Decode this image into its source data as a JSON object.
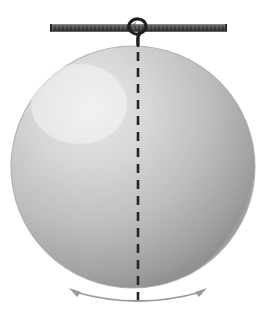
{
  "figure": {
    "type": "physics-diagram",
    "canvas": {
      "width": 269,
      "height": 328,
      "background": "#ffffff"
    },
    "support_rod": {
      "name": "horizontal support rod",
      "x_start": 50,
      "x_end": 227,
      "y_top": 24,
      "y_bottom": 31,
      "color_top": "#7c7c7c",
      "color_body": "#4a4a4a",
      "color_bottom": "#2b2b2b",
      "hatch_color": "#8d8d8d"
    },
    "hook": {
      "name": "suspension hook",
      "pivot_x": 138,
      "pivot_y": 27,
      "loop_radius": 7,
      "stroke_color": "#1e1e1e",
      "stroke_width": 3.2
    },
    "sphere": {
      "name": "pendulum bob sphere",
      "center_x": 133,
      "center_y": 167,
      "radius_x": 122,
      "radius_y": 121,
      "fill_light": "#f2f2f2",
      "fill_mid": "#d9d9d9",
      "fill_dark": "#bdbdbd",
      "edge_color": "#a8a8a8",
      "highlight_x": 78,
      "highlight_y": 102
    },
    "axis_line": {
      "name": "vertical dashed axis of rotation",
      "x": 138,
      "y_start": 36,
      "y_end": 306,
      "color": "#262626",
      "width": 2.6,
      "dash": "9 7"
    },
    "oscillation_arrow": {
      "name": "double headed curved oscillation arrow",
      "color": "#9a9a9a",
      "stroke_width": 1.8,
      "left_tip_x": 71,
      "left_tip_y": 291,
      "right_tip_x": 205,
      "right_tip_y": 291,
      "bottom_x": 138,
      "bottom_y": 310,
      "head_size": 7
    }
  }
}
